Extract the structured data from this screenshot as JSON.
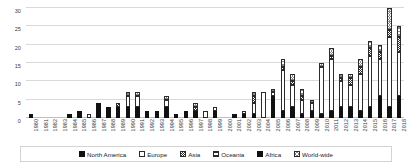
{
  "chart_data": {
    "type": "bar",
    "title": "",
    "subtitle": "",
    "xlabel": "",
    "ylabel": "",
    "ylim": [
      0,
      30
    ],
    "yticks": [
      0,
      5,
      10,
      15,
      20,
      25,
      30
    ],
    "grid": true,
    "stacked": true,
    "legend_position": "bottom",
    "categories": [
      "1980",
      "1981",
      "1982",
      "1983",
      "1984",
      "1985",
      "1986",
      "1987",
      "1988",
      "1989",
      "1990",
      "1991",
      "1992",
      "1993",
      "1994",
      "1995",
      "1996",
      "1997",
      "1998",
      "1999",
      "2000",
      "2001",
      "2002",
      "2003",
      "2004",
      "2005",
      "2006",
      "2007",
      "2008",
      "2009",
      "2010",
      "2011",
      "2012",
      "2013",
      "2014",
      "2015",
      "2016",
      "2017",
      "2018"
    ],
    "series": [
      {
        "name": "North America",
        "color": "#111111",
        "fill": "solid-black",
        "values": [
          1,
          0,
          0,
          0,
          1,
          2,
          0,
          4,
          3,
          3,
          3,
          3,
          2,
          2,
          3,
          1,
          2,
          2,
          0,
          2,
          0,
          1,
          1,
          1,
          0,
          6,
          2,
          3,
          1,
          2,
          1,
          2,
          3,
          3,
          2,
          3,
          6,
          3,
          6
        ]
      },
      {
        "name": "Europe",
        "color": "#ffffff",
        "fill": "outline-white",
        "values": [
          0,
          0,
          0,
          0,
          0,
          0,
          1,
          0,
          0,
          0,
          3,
          3,
          0,
          0,
          2,
          0,
          0,
          0,
          2,
          1,
          0,
          0,
          1,
          3,
          7,
          1,
          11,
          6,
          4,
          2,
          13,
          14,
          7,
          6,
          10,
          14,
          10,
          19,
          12
        ]
      },
      {
        "name": "Asia",
        "color": "#ffffff",
        "fill": "checker",
        "values": [
          0,
          0,
          0,
          0,
          0,
          0,
          0,
          0,
          0,
          1,
          0,
          0,
          0,
          0,
          0,
          0,
          0,
          1,
          0,
          0,
          0,
          0,
          0,
          2,
          0,
          0,
          1,
          1,
          1,
          0,
          0,
          1,
          1,
          2,
          2,
          2,
          2,
          2,
          4
        ]
      },
      {
        "name": "Oceania",
        "color": "#ffffff",
        "fill": "horizontal-lines",
        "values": [
          0,
          0,
          0,
          0,
          0,
          0,
          0,
          0,
          0,
          0,
          0,
          0,
          0,
          0,
          0,
          0,
          0,
          0,
          0,
          0,
          0,
          0,
          0,
          0,
          0,
          0,
          0,
          0,
          0,
          0,
          0,
          0,
          0,
          0,
          0,
          0,
          0,
          0,
          0
        ]
      },
      {
        "name": "Africa",
        "color": "#111111",
        "fill": "solid-black",
        "values": [
          0,
          0,
          0,
          0,
          0,
          0,
          0,
          0,
          0,
          0,
          0,
          0,
          0,
          0,
          0,
          0,
          0,
          0,
          0,
          0,
          0,
          0,
          0,
          0,
          0,
          0,
          0,
          0,
          0,
          0,
          0,
          0,
          0,
          0,
          0,
          0,
          0,
          0,
          0
        ]
      },
      {
        "name": "World-wide",
        "color": "#8a8a8a",
        "fill": "cross-hatch",
        "values": [
          0,
          0,
          0,
          0,
          0,
          0,
          0,
          0,
          0,
          0,
          1,
          1,
          0,
          0,
          1,
          0,
          0,
          1,
          0,
          0,
          0,
          0,
          0,
          1,
          0,
          1,
          2,
          2,
          2,
          1,
          1,
          2,
          1,
          1,
          2,
          2,
          2,
          6,
          3
        ]
      }
    ],
    "totals": [
      1,
      0,
      0,
      0,
      1,
      2,
      1,
      4,
      3,
      4,
      7,
      7,
      2,
      2,
      6,
      1,
      2,
      4,
      2,
      3,
      0,
      1,
      2,
      6.5,
      7,
      8,
      15.5,
      11.5,
      7.5,
      4.5,
      14.5,
      18.5,
      11.5,
      11.5,
      15.5,
      20.5,
      19.5,
      29.5,
      24.5
    ]
  },
  "legend": {
    "items": [
      {
        "label": "North America",
        "swatch": "solid-black-swatch"
      },
      {
        "label": "Europe",
        "swatch": "outline-white-swatch"
      },
      {
        "label": "Asia",
        "swatch": "checker-swatch"
      },
      {
        "label": "Oceania",
        "swatch": "horizontal-lines-swatch"
      },
      {
        "label": "Africa",
        "swatch": "solid-black-swatch"
      },
      {
        "label": "World-wide",
        "swatch": "cross-hatch-swatch"
      }
    ]
  }
}
